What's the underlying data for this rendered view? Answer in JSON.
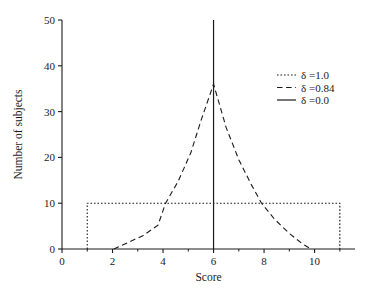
{
  "chart_data": {
    "type": "line",
    "title": "",
    "xlabel": "Score",
    "ylabel": "Number of subjects",
    "xlim": [
      0,
      11.6
    ],
    "ylim": [
      0,
      50
    ],
    "xticks": [
      "0",
      "2",
      "4",
      "6",
      "8",
      "10"
    ],
    "xtick_values": [
      0,
      2,
      4,
      6,
      8,
      10
    ],
    "yticks": [
      "0",
      "10",
      "20",
      "30",
      "40",
      "50"
    ],
    "ytick_values": [
      0,
      10,
      20,
      30,
      40,
      50
    ],
    "grid": false,
    "legend_position": "upper right",
    "series": [
      {
        "name": "delta-1.0",
        "legend_label": "δ =1.0",
        "delta": "1.0",
        "linestyle": "dotted",
        "color": "#1a1a1a",
        "description": "uniform distribution plateau at 10 subjects from score 1 to score 11",
        "x": [
          1,
          1,
          11,
          11
        ],
        "y": [
          0,
          10,
          10,
          0
        ]
      },
      {
        "name": "delta-0.84",
        "legend_label": "δ =0.84",
        "delta": "0.84",
        "linestyle": "dashed",
        "color": "#1a1a1a",
        "description": "peaked tent-shaped distribution centered at score 6 peaking at 36 subjects",
        "x": [
          2.05,
          2.6,
          3.2,
          3.8,
          4.1,
          4.6,
          5.1,
          5.5,
          6.0,
          6.5,
          7.0,
          7.5,
          7.9,
          8.4,
          9.0,
          9.5,
          9.85
        ],
        "y": [
          0,
          1.4,
          2.9,
          5.2,
          10.0,
          14.8,
          21.0,
          28.0,
          36.0,
          26.5,
          19.5,
          14.0,
          10.0,
          6.6,
          3.4,
          1.2,
          0
        ]
      },
      {
        "name": "delta-0.0",
        "legend_label": "δ =0.0",
        "delta": "0.0",
        "linestyle": "solid",
        "color": "#1a1a1a",
        "description": "degenerate spike at score 6 reaching 50 subjects",
        "x": [
          6,
          6
        ],
        "y": [
          0,
          50
        ]
      }
    ]
  },
  "legend": {
    "entries": [
      {
        "label": "δ =1.0",
        "style": "dotted"
      },
      {
        "label": "δ =0.84",
        "style": "dashed"
      },
      {
        "label": "δ =0.0",
        "style": "solid"
      }
    ]
  },
  "axes": {
    "x_title": "Score",
    "y_title": "Number of subjects"
  },
  "colors": {
    "ink": "#1a1a1a",
    "background": "#ffffff"
  }
}
